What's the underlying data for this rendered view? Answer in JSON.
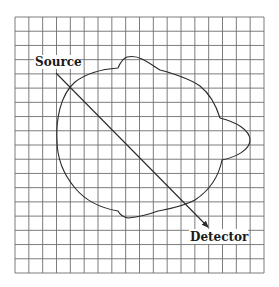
{
  "diagram": {
    "labels": {
      "source": "Source",
      "detector": "Detector"
    },
    "grid": {
      "left": 15,
      "top": 17,
      "right": 264,
      "bottom": 273,
      "columns": 18,
      "rows": 18,
      "color": "#6e6e6e"
    },
    "colors": {
      "line": "#2a2a2a",
      "background": "#ffffff"
    }
  }
}
